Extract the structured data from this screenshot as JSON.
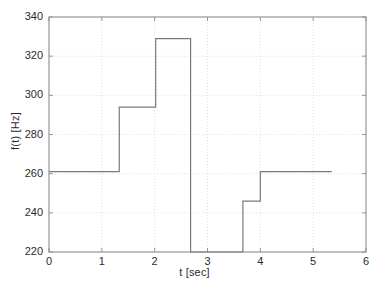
{
  "chart_data": {
    "type": "line",
    "subtype": "step",
    "title": "",
    "xlabel": "t [sec]",
    "ylabel": "f(t) [Hz]",
    "xlim": [
      0,
      6
    ],
    "ylim": [
      220,
      340
    ],
    "xticks": [
      0,
      1,
      2,
      3,
      4,
      5,
      6
    ],
    "yticks": [
      220,
      240,
      260,
      280,
      300,
      320,
      340
    ],
    "xticklabels": [
      "0",
      "1",
      "2",
      "3",
      "4",
      "5",
      "6"
    ],
    "yticklabels": [
      "220",
      "240",
      "260",
      "280",
      "300",
      "320",
      "340"
    ],
    "grid": true,
    "grid_style": "dotted",
    "legend": null,
    "line_color": "#7a7a7a",
    "grid_color": "#d8d8d8",
    "axis_color": "#8c8c8c",
    "background": "#ffffff",
    "segments": [
      {
        "t_start": 0.0,
        "t_end": 1.33,
        "value": 261
      },
      {
        "t_start": 1.33,
        "t_end": 2.02,
        "value": 294
      },
      {
        "t_start": 2.02,
        "t_end": 2.68,
        "value": 329
      },
      {
        "t_start": 3.67,
        "t_end": 4.0,
        "value": 246
      },
      {
        "t_start": 4.0,
        "t_end": 5.35,
        "value": 261
      }
    ],
    "drops_to_floor": [
      {
        "t": 2.68,
        "from": 329,
        "to": 220
      },
      {
        "t": 3.67,
        "from": 220,
        "to": 246
      }
    ],
    "x": [
      0.0,
      1.33,
      1.33,
      2.02,
      2.02,
      2.68,
      2.68,
      3.67,
      3.67,
      4.0,
      4.0,
      5.35
    ],
    "y": [
      261,
      261,
      294,
      294,
      329,
      329,
      220,
      220,
      246,
      246,
      261,
      261
    ]
  },
  "figure": {
    "plot_area": {
      "left": 49,
      "top": 17,
      "right": 366,
      "bottom": 252
    }
  }
}
